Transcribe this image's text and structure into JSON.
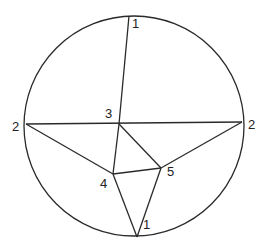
{
  "diagram": {
    "type": "graph-in-circle",
    "circle": {
      "cx": 134,
      "cy": 126,
      "r": 110
    },
    "nodes": [
      {
        "id": "top",
        "label": "1",
        "x": 129,
        "y": 16,
        "lx": 132,
        "ly": 28
      },
      {
        "id": "left",
        "label": "2",
        "x": 26,
        "y": 124,
        "lx": 12,
        "ly": 131
      },
      {
        "id": "right",
        "label": "2",
        "x": 242,
        "y": 122,
        "lx": 248,
        "ly": 129
      },
      {
        "id": "center",
        "label": "3",
        "x": 119,
        "y": 124,
        "lx": 105,
        "ly": 118
      },
      {
        "id": "n4",
        "label": "4",
        "x": 113,
        "y": 174,
        "lx": 100,
        "ly": 188
      },
      {
        "id": "n5",
        "label": "5",
        "x": 161,
        "y": 168,
        "lx": 167,
        "ly": 176
      },
      {
        "id": "bottom",
        "label": "1",
        "x": 137,
        "y": 237,
        "lx": 143,
        "ly": 229
      }
    ],
    "edges": [
      [
        "top",
        "center"
      ],
      [
        "left",
        "right"
      ],
      [
        "left",
        "n4"
      ],
      [
        "center",
        "n4"
      ],
      [
        "center",
        "n5"
      ],
      [
        "n4",
        "n5"
      ],
      [
        "right",
        "n5"
      ],
      [
        "n4",
        "bottom"
      ],
      [
        "n5",
        "bottom"
      ]
    ]
  }
}
